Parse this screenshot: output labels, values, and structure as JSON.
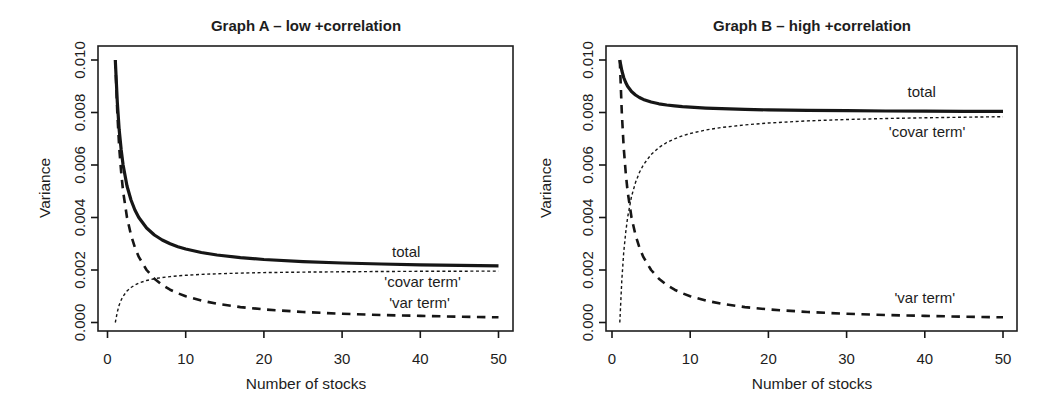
{
  "figure": {
    "background": "#ffffff",
    "text_color": "#1d1d1d",
    "line_color": "#161616"
  },
  "chart_data": [
    {
      "type": "line",
      "title": "Graph A – low +correlation",
      "xlabel": "Number of stocks",
      "ylabel": "Variance",
      "xlim": [
        0,
        50
      ],
      "ylim": [
        0,
        0.01
      ],
      "grid": false,
      "legend": "inline-labels",
      "xticks": [
        0,
        10,
        20,
        30,
        40,
        50
      ],
      "xtick_labels": [
        "0",
        "10",
        "20",
        "30",
        "40",
        "50"
      ],
      "yticks": [
        0,
        0.002,
        0.004,
        0.006,
        0.008,
        0.01
      ],
      "ytick_labels": [
        "0.000",
        "0.002",
        "0.004",
        "0.006",
        "0.008",
        "0.010"
      ],
      "x": [
        1,
        1.25,
        1.5,
        1.75,
        2,
        2.5,
        3,
        3.5,
        4,
        5,
        6,
        7,
        8,
        9,
        10,
        12,
        14,
        17,
        20,
        25,
        30,
        35,
        40,
        45,
        50
      ],
      "series": [
        {
          "name": "total",
          "label": "total",
          "line_style": "solid-thick",
          "label_x": 38.2,
          "label_y": 0.0027,
          "values": [
            0.01,
            0.0084,
            0.007333,
            0.006571,
            0.006,
            0.0052,
            0.004667,
            0.004286,
            0.004,
            0.0036,
            0.003333,
            0.003143,
            0.003,
            0.002889,
            0.0028,
            0.002667,
            0.002571,
            0.002471,
            0.0024,
            0.00232,
            0.002267,
            0.002229,
            0.0022,
            0.002178,
            0.00216
          ]
        },
        {
          "name": "covar term",
          "label": "'covar term'",
          "line_style": "short-dash-thin",
          "label_x": 40.3,
          "label_y": 0.00156,
          "values": [
            0,
            0.0004,
            0.000667,
            0.000857,
            0.001,
            0.0012,
            0.001333,
            0.001429,
            0.0015,
            0.0016,
            0.001667,
            0.001714,
            0.00175,
            0.001778,
            0.0018,
            0.001833,
            0.001857,
            0.001882,
            0.0019,
            0.00192,
            0.001933,
            0.001943,
            0.00195,
            0.001956,
            0.00196
          ]
        },
        {
          "name": "var term",
          "label": "'var term'",
          "line_style": "long-dash-thick",
          "label_x": 39.9,
          "label_y": 0.00076,
          "values": [
            0.01,
            0.008,
            0.006667,
            0.005714,
            0.005,
            0.004,
            0.003333,
            0.002857,
            0.0025,
            0.002,
            0.001667,
            0.001429,
            0.00125,
            0.001111,
            0.001,
            0.000833,
            0.000714,
            0.000588,
            0.0005,
            0.0004,
            0.000333,
            0.000286,
            0.00025,
            0.000222,
            0.0002
          ]
        }
      ]
    },
    {
      "type": "line",
      "title": "Graph B – high +correlation",
      "xlabel": "Number of stocks",
      "ylabel": "Variance",
      "xlim": [
        0,
        50
      ],
      "ylim": [
        0,
        0.01
      ],
      "grid": false,
      "legend": "inline-labels",
      "xticks": [
        0,
        10,
        20,
        30,
        40,
        50
      ],
      "xtick_labels": [
        "0",
        "10",
        "20",
        "30",
        "40",
        "50"
      ],
      "yticks": [
        0,
        0.002,
        0.004,
        0.006,
        0.008,
        0.01
      ],
      "ytick_labels": [
        "0.000",
        "0.002",
        "0.004",
        "0.006",
        "0.008",
        "0.010"
      ],
      "x": [
        1,
        1.25,
        1.5,
        1.75,
        2,
        2.5,
        3,
        3.5,
        4,
        5,
        6,
        7,
        8,
        9,
        10,
        12,
        14,
        17,
        20,
        25,
        30,
        35,
        40,
        45,
        50
      ],
      "series": [
        {
          "name": "total",
          "label": "total",
          "line_style": "solid-thick",
          "label_x": 39.6,
          "label_y": 0.0088,
          "values": [
            0.01,
            0.0096,
            0.009333,
            0.009143,
            0.009,
            0.0088,
            0.008667,
            0.008571,
            0.0085,
            0.0084,
            0.008333,
            0.008286,
            0.00825,
            0.008222,
            0.0082,
            0.008167,
            0.008143,
            0.008118,
            0.0081,
            0.00808,
            0.008067,
            0.008057,
            0.00805,
            0.008044,
            0.00804
          ]
        },
        {
          "name": "covar term",
          "label": "'covar term'",
          "line_style": "short-dash-thin",
          "label_x": 40.3,
          "label_y": 0.00726,
          "values": [
            0,
            0.0016,
            0.002667,
            0.003429,
            0.004,
            0.0048,
            0.005333,
            0.005714,
            0.006,
            0.0064,
            0.006667,
            0.006857,
            0.007,
            0.007111,
            0.0072,
            0.007333,
            0.007429,
            0.007529,
            0.0076,
            0.00768,
            0.007733,
            0.007771,
            0.0078,
            0.007822,
            0.00784
          ]
        },
        {
          "name": "var term",
          "label": "'var term'",
          "line_style": "long-dash-thick",
          "label_x": 40.0,
          "label_y": 0.00095,
          "values": [
            0.01,
            0.008,
            0.006667,
            0.005714,
            0.005,
            0.004,
            0.003333,
            0.002857,
            0.0025,
            0.002,
            0.001667,
            0.001429,
            0.00125,
            0.001111,
            0.001,
            0.000833,
            0.000714,
            0.000588,
            0.0005,
            0.0004,
            0.000333,
            0.000286,
            0.00025,
            0.000222,
            0.0002
          ]
        }
      ]
    }
  ]
}
